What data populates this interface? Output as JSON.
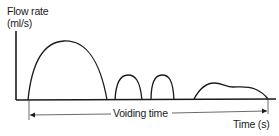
{
  "diagram": {
    "y_axis": {
      "label_line1": "Flow rate",
      "label_line2": "(ml/s)"
    },
    "x_axis": {
      "label": "Time (s)"
    },
    "annotation": {
      "label": "Voiding time",
      "arrow": "double-headed"
    },
    "curves": [
      {
        "name": "flow-segment-1",
        "shape": "large dome"
      },
      {
        "name": "flow-segment-2",
        "shape": "small dome"
      },
      {
        "name": "flow-segment-3",
        "shape": "small dome"
      },
      {
        "name": "flow-segment-4",
        "shape": "low plateau"
      }
    ],
    "colors": {
      "line": "#1a1a1a",
      "background": "#ffffff"
    }
  }
}
